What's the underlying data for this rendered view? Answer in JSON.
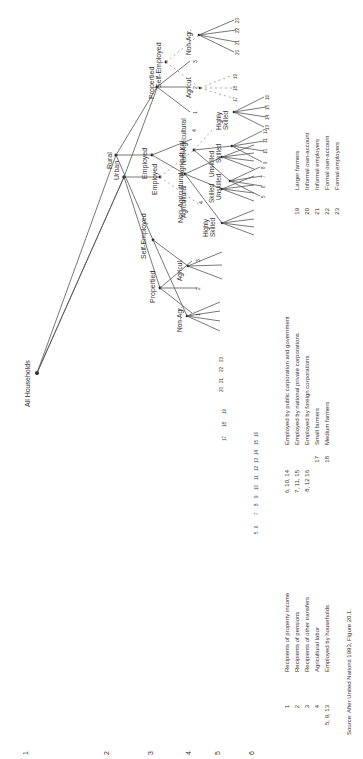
{
  "diagram": {
    "root": "All Households",
    "level_numbers": [
      "1",
      "2",
      "3",
      "4",
      "5",
      "6"
    ],
    "branches": {
      "rural": "Rural",
      "urban": "Urban",
      "propertied": "Propertied",
      "employed": "Employed",
      "self_employed": "Self-Employed",
      "agricultural": "Agricultural",
      "non_agricultural": "Non-Agricultural",
      "agricul": "Agricul.",
      "non_agr": "Non-Agr.",
      "unskilled": "Unskilled",
      "skilled": "Skilled",
      "highly": "Highly",
      "skilled2": "Skilled",
      "agri_leaf": "4"
    },
    "leaves": {
      "propertied": [
        "1",
        "2",
        "3"
      ],
      "unskilled": [
        "5",
        "6",
        "7",
        "8"
      ],
      "skilled": [
        "9",
        "10",
        "11",
        "12"
      ],
      "highly_skilled": [
        "13",
        "14",
        "15",
        "16"
      ],
      "agricul": [
        "17",
        "18",
        "19"
      ],
      "non_agr": [
        "20",
        "21",
        "22",
        "23"
      ]
    }
  },
  "legend": [
    {
      "code": "1",
      "text": "Recipients of property income"
    },
    {
      "code": "2",
      "text": "Recipients of pensions"
    },
    {
      "code": "3",
      "text": "Recipients of other transfers"
    },
    {
      "code": "4",
      "text": "Agricultural labor"
    },
    {
      "code": "5, 9, 13",
      "text": "Employed by households"
    },
    {
      "code": "6, 10, 14",
      "text": "Employed by public corporation and government"
    },
    {
      "code": "7, 11, 15",
      "text": "Employed by national private corporations"
    },
    {
      "code": "8, 12 16",
      "text": "Employed by foreign corporations"
    },
    {
      "code": "17",
      "text": "Small farmers"
    },
    {
      "code": "18",
      "text": "Medium farmers"
    },
    {
      "code": "19",
      "text": "Larger farmers"
    },
    {
      "code": "20",
      "text": "Informal own-account"
    },
    {
      "code": "21",
      "text": "Informal employers"
    },
    {
      "code": "22",
      "text": "Formal own-account"
    },
    {
      "code": "23",
      "text": "Formal employers"
    }
  ],
  "source": "Source:   After United Nations 1993, Figure 20.1."
}
